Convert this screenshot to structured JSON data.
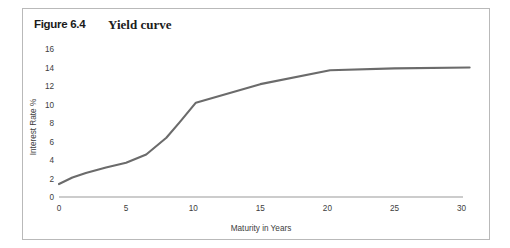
{
  "figure": {
    "number": "Figure 6.4",
    "title": "Yield curve"
  },
  "colors": {
    "line": "#6b6b6b",
    "axis": "#9a9a9a",
    "frame": "#b9b9b9",
    "text": "#3d3d3d",
    "background": "#ffffff"
  },
  "chart_data": {
    "type": "line",
    "title": "Yield curve",
    "xlabel": "Maturity in Years",
    "ylabel": "Interest Rate %",
    "xlim": [
      0,
      31
    ],
    "ylim": [
      0,
      16
    ],
    "xticks": [
      0,
      5,
      10,
      15,
      20,
      25,
      30
    ],
    "xticklabels": [
      "0",
      "5",
      "10",
      "15",
      "20",
      "25",
      "30"
    ],
    "yticks": [
      0,
      2,
      4,
      6,
      8,
      10,
      12,
      14,
      16
    ],
    "yticklabels": [
      "0",
      "2",
      "4",
      "6",
      "8",
      "10",
      "12",
      "14",
      "16"
    ],
    "grid": false,
    "legend": false,
    "series": [
      {
        "name": "Yield curve",
        "x": [
          0.0,
          1.0,
          2.0,
          3.5,
          5.0,
          6.5,
          8.0,
          9.0,
          10.2,
          15.0,
          20.2,
          25.0,
          30.6
        ],
        "values": [
          1.4,
          2.1,
          2.6,
          3.2,
          3.7,
          4.6,
          6.4,
          8.1,
          10.2,
          12.2,
          13.7,
          13.9,
          14.0
        ]
      }
    ]
  }
}
